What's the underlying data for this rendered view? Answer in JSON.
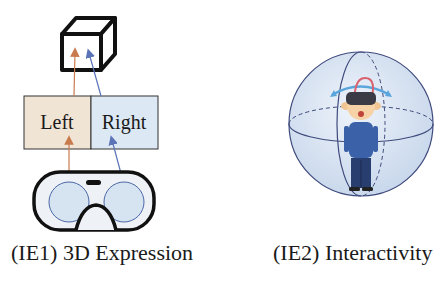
{
  "panels": [
    {
      "id": "IE1",
      "caption": "(IE1) 3D Expression",
      "boxes": [
        {
          "label": "Left",
          "fill": "#f0e4d4"
        },
        {
          "label": "Right",
          "fill": "#dce8f3"
        }
      ],
      "arrow_colors": {
        "left": "#c97b4e",
        "right": "#5b74b8"
      },
      "elements": [
        "cube-icon",
        "left-right-boxes",
        "vr-headset-icon"
      ]
    },
    {
      "id": "IE2",
      "caption": "(IE2) Interactivity",
      "elements": [
        "sphere",
        "person-with-vr-headset-icon",
        "rotation-arrows"
      ],
      "arrow_colors": {
        "yaw": "#5aa6dc",
        "pitch": "#d9606d"
      }
    }
  ]
}
